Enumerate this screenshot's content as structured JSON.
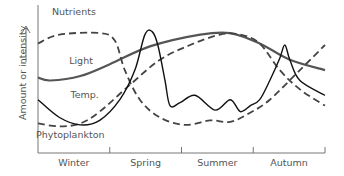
{
  "chart_data": {
    "type": "line",
    "title": "",
    "xlabel": "",
    "ylabel": "Amount or intensity",
    "x_categories": [
      "Winter",
      "Spring",
      "Summer",
      "Autumn"
    ],
    "xlim": [
      0,
      4
    ],
    "ylim": [
      0,
      1
    ],
    "grid": false,
    "legend": "inline labels",
    "series": [
      {
        "name": "Light",
        "style": "thick-solid",
        "color": "#555555",
        "points": [
          [
            0,
            0.51
          ],
          [
            0.17,
            0.49
          ],
          [
            0.59,
            0.52
          ],
          [
            1.0,
            0.6
          ],
          [
            1.56,
            0.72
          ],
          [
            2.26,
            0.8
          ],
          [
            2.68,
            0.81
          ],
          [
            3.09,
            0.74
          ],
          [
            3.51,
            0.63
          ],
          [
            4.0,
            0.56
          ]
        ]
      },
      {
        "name": "Nutrients",
        "style": "dashed",
        "color": "#444444",
        "points": [
          [
            0,
            0.74
          ],
          [
            0.3,
            0.8
          ],
          [
            0.86,
            0.81
          ],
          [
            1.07,
            0.76
          ],
          [
            1.21,
            0.56
          ],
          [
            1.42,
            0.36
          ],
          [
            1.7,
            0.24
          ],
          [
            2.05,
            0.19
          ],
          [
            2.4,
            0.22
          ],
          [
            2.68,
            0.21
          ],
          [
            2.95,
            0.27
          ],
          [
            3.23,
            0.36
          ],
          [
            3.65,
            0.56
          ],
          [
            4.0,
            0.73
          ]
        ]
      },
      {
        "name": "Temp.",
        "style": "dashed",
        "color": "#444444",
        "points": [
          [
            0,
            0.2
          ],
          [
            0.3,
            0.18
          ],
          [
            0.59,
            0.2
          ],
          [
            0.86,
            0.28
          ],
          [
            1.28,
            0.46
          ],
          [
            1.7,
            0.63
          ],
          [
            2.12,
            0.73
          ],
          [
            2.54,
            0.8
          ],
          [
            2.82,
            0.8
          ],
          [
            3.09,
            0.74
          ],
          [
            3.37,
            0.56
          ],
          [
            3.65,
            0.43
          ],
          [
            4.0,
            0.32
          ]
        ]
      },
      {
        "name": "Phytoplankton",
        "style": "thin-solid",
        "color": "#111111",
        "points": [
          [
            0,
            0.36
          ],
          [
            0.3,
            0.24
          ],
          [
            0.59,
            0.19
          ],
          [
            0.86,
            0.22
          ],
          [
            1.14,
            0.36
          ],
          [
            1.35,
            0.56
          ],
          [
            1.49,
            0.8
          ],
          [
            1.59,
            0.82
          ],
          [
            1.67,
            0.73
          ],
          [
            1.77,
            0.49
          ],
          [
            1.84,
            0.32
          ],
          [
            1.98,
            0.34
          ],
          [
            2.19,
            0.39
          ],
          [
            2.47,
            0.29
          ],
          [
            2.68,
            0.36
          ],
          [
            2.82,
            0.28
          ],
          [
            2.96,
            0.32
          ],
          [
            3.09,
            0.36
          ],
          [
            3.23,
            0.49
          ],
          [
            3.37,
            0.64
          ],
          [
            3.44,
            0.73
          ],
          [
            3.51,
            0.63
          ],
          [
            3.65,
            0.49
          ],
          [
            4.0,
            0.39
          ]
        ]
      }
    ],
    "annotations": [
      {
        "text": "Nutrients",
        "series": "Nutrients",
        "at": [
          0.5,
          0.93
        ]
      },
      {
        "text": "Light",
        "series": "Light",
        "at": [
          0.6,
          0.6
        ]
      },
      {
        "text": "Temp.",
        "series": "Temp.",
        "at": [
          0.65,
          0.37
        ]
      },
      {
        "text": "Phytoplankton",
        "series": "Phytoplankton",
        "at": [
          0.45,
          0.1
        ]
      }
    ]
  }
}
